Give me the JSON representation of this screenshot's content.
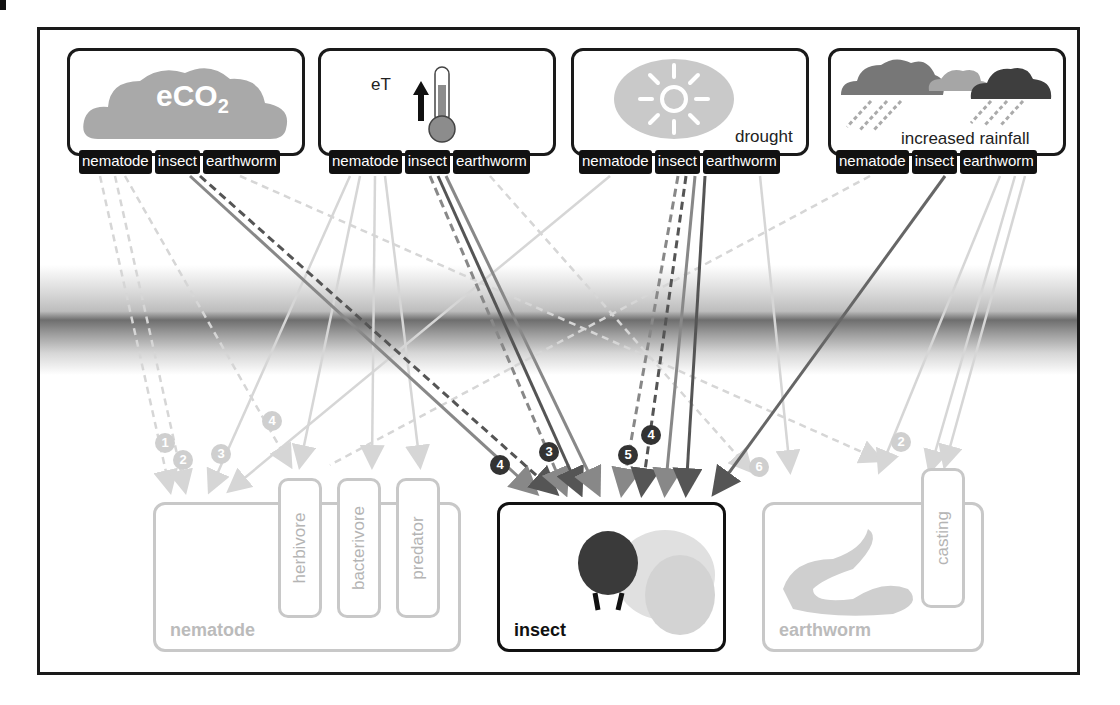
{
  "figure": {
    "drivers": [
      {
        "id": "eco2",
        "icon": "cloud-co2-icon",
        "label_main": "eCO",
        "label_sub": "2",
        "tags": [
          "nematode",
          "insect",
          "earthworm"
        ]
      },
      {
        "id": "et",
        "icon": "thermometer-icon",
        "label": "eT",
        "tags": [
          "nematode",
          "insect",
          "earthworm"
        ]
      },
      {
        "id": "drought",
        "icon": "sun-icon",
        "label": "drought",
        "tags": [
          "nematode",
          "insect",
          "earthworm"
        ]
      },
      {
        "id": "rainfall",
        "icon": "rain-clouds-icon",
        "label": "increased rainfall",
        "tags": [
          "nematode",
          "insect",
          "earthworm"
        ]
      }
    ],
    "organisms": {
      "nematode": {
        "label": "nematode",
        "subgroups": [
          "herbivore",
          "bacterivore",
          "predator"
        ]
      },
      "insect": {
        "label": "insect"
      },
      "earthworm": {
        "label": "earthworm",
        "subgroups": [
          "casting"
        ]
      }
    },
    "badges": [
      {
        "text": "1",
        "style": "light"
      },
      {
        "text": "2",
        "style": "light"
      },
      {
        "text": "3",
        "style": "light"
      },
      {
        "text": "4",
        "style": "light"
      },
      {
        "text": "4",
        "style": "dark"
      },
      {
        "text": "3",
        "style": "dark"
      },
      {
        "text": "5",
        "style": "dark"
      },
      {
        "text": "4",
        "style": "dark"
      },
      {
        "text": "6",
        "style": "light"
      },
      {
        "text": "2",
        "style": "light"
      }
    ],
    "colors": {
      "frame": "#1a1a1a",
      "tag_bg": "#111111",
      "faded": "#c8c8c8",
      "arrow_dark": "#555555",
      "arrow_mid": "#888888"
    }
  }
}
